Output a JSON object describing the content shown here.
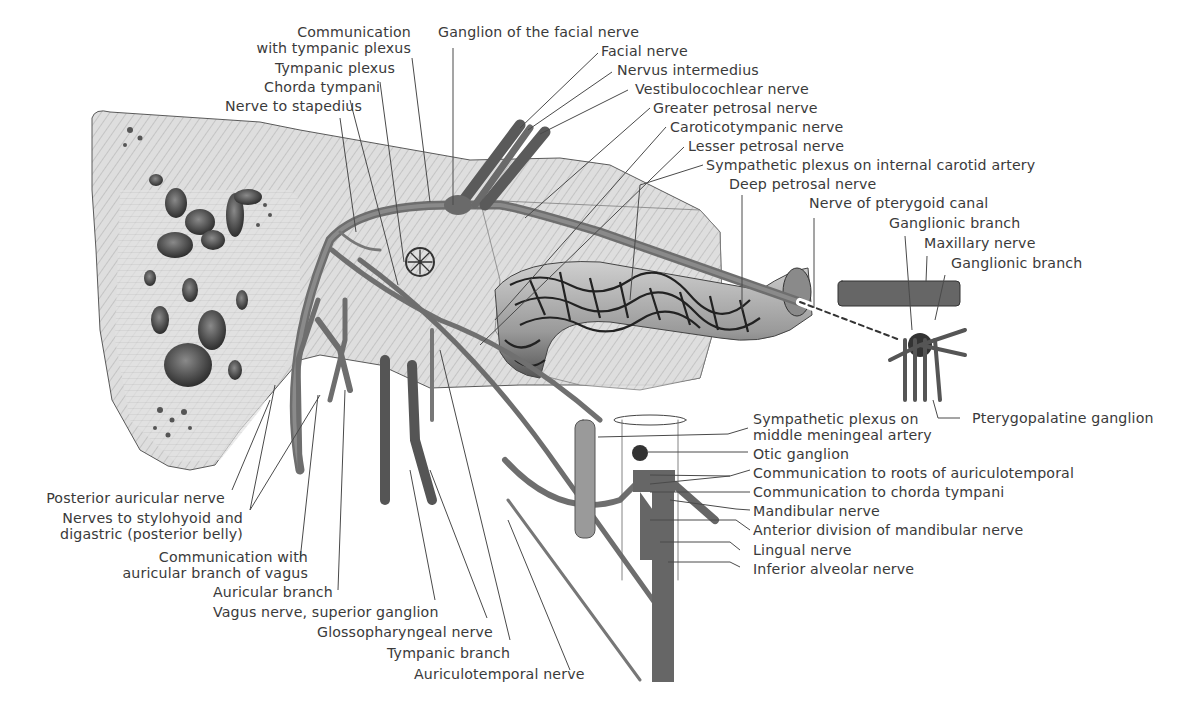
{
  "figure": {
    "colors": {
      "background": "#ffffff",
      "bone": "#dcdcdc",
      "bone_dark": "#b9b9b9",
      "nerve": "#6f6f6f",
      "nerve_dark": "#4a4a4a",
      "plexus": "#2a2a2a",
      "label_text": "#3a3a3a",
      "leader_line": "#4a4a4a"
    }
  },
  "labels": {
    "top": {
      "communication_tympanic": [
        "Communication",
        "with tympanic plexus"
      ],
      "tympanic_plexus": "Tympanic plexus",
      "chorda_tympani": "Chorda tympani",
      "nerve_to_stapedius": "Nerve to stapedius",
      "ganglion_facial": "Ganglion of the facial nerve"
    },
    "top_right": {
      "facial_nerve": "Facial nerve",
      "nervus_intermedius": "Nervus intermedius",
      "vestibulocochlear": "Vestibulocochlear nerve",
      "greater_petrosal": "Greater petrosal nerve",
      "caroticotympanic": "Caroticotympanic nerve",
      "lesser_petrosal": "Lesser petrosal nerve",
      "sympathetic_ica": "Sympathetic plexus on internal carotid artery",
      "deep_petrosal": "Deep petrosal nerve",
      "pterygoid_canal": "Nerve of pterygoid canal",
      "ganglionic_branch_1": "Ganglionic branch",
      "maxillary_nerve": "Maxillary nerve",
      "ganglionic_branch_2": "Ganglionic branch"
    },
    "right": {
      "pterygopalatine": "Pterygopalatine ganglion",
      "sympathetic_mma": [
        "Sympathetic plexus on",
        "middle meningeal artery"
      ],
      "otic_ganglion": "Otic ganglion",
      "comm_auriculotemporal": "Communication to roots of auriculotemporal",
      "comm_chorda": "Communication to chorda tympani",
      "mandibular": "Mandibular nerve",
      "anterior_division": "Anterior division of mandibular nerve",
      "lingual": "Lingual nerve",
      "inferior_alveolar": "Inferior alveolar nerve"
    },
    "bottom_left": {
      "posterior_auricular": "Posterior auricular nerve",
      "stylohyoid_digastric": [
        "Nerves to stylohyoid and",
        "digastric (posterior belly)"
      ],
      "comm_auricular_vagus": [
        "Communication with",
        "auricular branch of vagus"
      ],
      "auricular_branch": "Auricular branch",
      "vagus_superior": "Vagus nerve, superior ganglion",
      "glossopharyngeal": "Glossopharyngeal nerve",
      "tympanic_branch": "Tympanic branch",
      "auriculotemporal": "Auriculotemporal nerve"
    }
  }
}
